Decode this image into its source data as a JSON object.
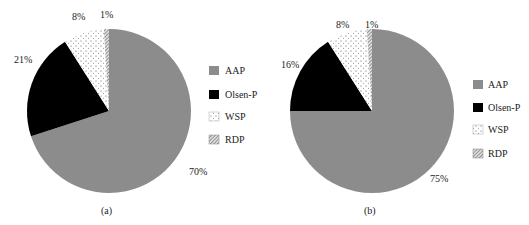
{
  "chart_data": [
    {
      "type": "pie",
      "title": "",
      "caption": "(a)",
      "categories": [
        "AAP",
        "Olsen-P",
        "WSP",
        "RDP"
      ],
      "values": [
        70,
        21,
        8,
        1
      ],
      "labels": [
        "70%",
        "21%",
        "8%",
        "1%"
      ],
      "colors": [
        "#8c8c8c",
        "#000000",
        "dotted-white",
        "hatched-gray"
      ],
      "legend_position": "right"
    },
    {
      "type": "pie",
      "title": "",
      "caption": "(b)",
      "categories": [
        "AAP",
        "Olsen-P",
        "WSP",
        "RDP"
      ],
      "values": [
        75,
        16,
        8,
        1
      ],
      "labels": [
        "75%",
        "16%",
        "8%",
        "1%"
      ],
      "colors": [
        "#8c8c8c",
        "#000000",
        "dotted-white",
        "hatched-gray"
      ],
      "legend_position": "right"
    }
  ],
  "legend": {
    "items": [
      "AAP",
      "Olsen-P",
      "WSP",
      "RDP"
    ]
  },
  "captions": {
    "a": "(a)",
    "b": "(b)"
  }
}
